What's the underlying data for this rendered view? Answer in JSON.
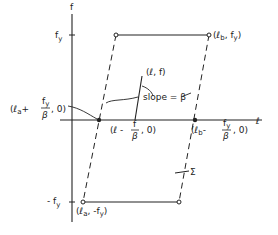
{
  "diagram": {
    "type": "hysteresis / yield parallelogram",
    "axes": {
      "vertical_label": "f",
      "horizontal_label": "ℓ",
      "ticks": {
        "top": "f",
        "top_sub": "y",
        "bottom": "- f",
        "bottom_sub": "y"
      }
    },
    "points": {
      "top_right": "(ℓ",
      "top_right_sub": "b",
      "top_right_tail": ", f",
      "top_right_tail_sub": "y",
      "top_right_close": ")",
      "bottom_left": "(ℓ",
      "bottom_left_sub": "a",
      "bottom_left_tail": ", -f",
      "bottom_left_tail_sub": "y",
      "bottom_left_close": ")",
      "current": "(ℓ, f)",
      "left_intercept_open": "(ℓ",
      "left_intercept_sub": "a",
      "left_intercept_plus": "+",
      "left_intercept_num": "f",
      "left_intercept_num_sub": "y",
      "left_intercept_den": "β",
      "left_intercept_close": ", 0)",
      "mid_intercept_open": "(ℓ -",
      "mid_intercept_num": "f",
      "mid_intercept_den": "β",
      "mid_intercept_close": ", 0)",
      "right_intercept_open": "(ℓ",
      "right_intercept_sub": "b",
      "right_intercept_minus": "-",
      "right_intercept_num": "f",
      "right_intercept_num_sub": "y",
      "right_intercept_den": "β",
      "right_intercept_close": ", 0)"
    },
    "annotations": {
      "slope": "slope = β",
      "sigma": "Σ"
    }
  }
}
